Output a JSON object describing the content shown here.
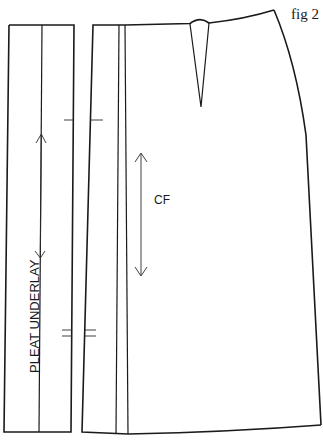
{
  "figure": {
    "label": "fig 2"
  },
  "pieces": {
    "pleat_underlay": {
      "label": "PLEAT UNDERLAY"
    },
    "front_skirt": {
      "grainline_label": "CF"
    }
  },
  "colors": {
    "line": "#1a1a1a",
    "background": "#ffffff"
  }
}
